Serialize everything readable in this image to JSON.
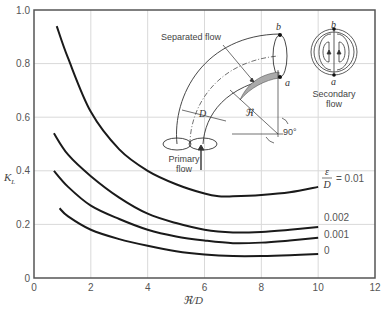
{
  "chart_data": {
    "type": "line",
    "title": "",
    "xlabel": "ℜ/D",
    "ylabel": "K_L",
    "xlim": [
      0,
      12
    ],
    "ylim": [
      0,
      1.0
    ],
    "grid": true,
    "x_ticks": [
      "0",
      "2",
      "4",
      "6",
      "8",
      "10",
      "12"
    ],
    "y_ticks": [
      "0",
      "0.2",
      "0.4",
      "0.6",
      "0.8",
      "1.0"
    ],
    "legend_title": "ε/D",
    "series": [
      {
        "name": "ε/D = 0.01",
        "label": "= 0.01",
        "x": [
          0.8,
          1.2,
          2,
          3,
          4,
          5,
          6,
          6.5,
          7,
          8,
          9,
          10
        ],
        "y": [
          0.94,
          0.82,
          0.62,
          0.48,
          0.4,
          0.35,
          0.315,
          0.305,
          0.305,
          0.31,
          0.32,
          0.34
        ]
      },
      {
        "name": "ε/D = 0.002",
        "label": "0.002",
        "x": [
          0.7,
          1.2,
          2,
          3,
          4,
          5,
          6,
          7,
          8,
          9,
          10
        ],
        "y": [
          0.54,
          0.46,
          0.38,
          0.3,
          0.24,
          0.205,
          0.18,
          0.17,
          0.172,
          0.18,
          0.19
        ]
      },
      {
        "name": "ε/D = 0.001",
        "label": "0.001",
        "x": [
          0.7,
          1.2,
          2,
          3,
          4,
          5,
          6,
          7,
          8,
          9,
          10
        ],
        "y": [
          0.4,
          0.34,
          0.27,
          0.22,
          0.18,
          0.155,
          0.14,
          0.13,
          0.132,
          0.14,
          0.15
        ]
      },
      {
        "name": "ε/D = 0",
        "label": "0",
        "x": [
          0.9,
          1.2,
          2,
          3,
          4,
          5,
          6,
          7,
          8,
          9,
          10
        ],
        "y": [
          0.26,
          0.23,
          0.18,
          0.145,
          0.12,
          0.1,
          0.088,
          0.082,
          0.082,
          0.085,
          0.09
        ]
      }
    ],
    "annotations": [
      "Separated flow",
      "Primary flow",
      "Secondary flow",
      "D",
      "ℜ",
      "90°",
      "a",
      "b"
    ]
  },
  "axes": {
    "x_label": "ℜ/D",
    "y_label": "K",
    "y_label_sub": "L"
  },
  "inset": {
    "separated_flow": "Separated flow",
    "primary_flow_line1": "Primary",
    "primary_flow_line2": "flow",
    "secondary_flow_line1": "Secondary",
    "secondary_flow_line2": "flow",
    "diameter_symbol": "D",
    "radius_symbol": "ℜ",
    "angle": "90°",
    "point_a": "a",
    "point_b": "b"
  },
  "legend": {
    "epsilon": "ε",
    "D": "D",
    "first_value": "= 0.01"
  },
  "colors": {
    "curve": "#1a1a1a",
    "grid": "#d9d9d9",
    "axis": "#555555"
  }
}
